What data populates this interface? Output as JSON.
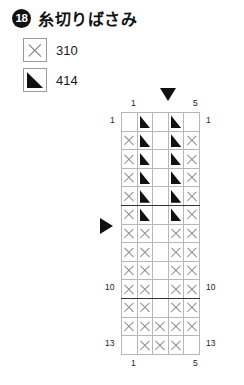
{
  "header": {
    "number": "18",
    "title": "糸切りばさみ"
  },
  "legend": {
    "items": [
      {
        "symbol": "cross",
        "symbol_name": "cross-symbol",
        "label": "310"
      },
      {
        "symbol": "triangle",
        "symbol_name": "triangle-symbol",
        "label": "414"
      }
    ]
  },
  "markers": {
    "top_arrow": "down-arrow-marker",
    "left_arrow": "right-arrow-marker"
  },
  "axis": {
    "columns_top": {
      "first": "1",
      "last": "5"
    },
    "columns_bottom": {
      "first": "1",
      "last": "5"
    },
    "rows_left": {
      "first": "1",
      "middle": "10",
      "last": "13"
    },
    "rows_right": {
      "first": "1",
      "middle": "10",
      "last": "13"
    }
  },
  "chart_data": {
    "type": "heatmap",
    "title": "糸切りばさみ",
    "xlabel": "",
    "ylabel": "",
    "columns": 5,
    "rows": 13,
    "legend_position": "top-left",
    "grid": true,
    "symbol_key": {
      "0": "empty",
      "x": "cross-310",
      "t": "triangle-414"
    },
    "cells": [
      [
        "0",
        "t",
        "0",
        "t",
        "0"
      ],
      [
        "x",
        "t",
        "0",
        "t",
        "x"
      ],
      [
        "x",
        "t",
        "0",
        "t",
        "x"
      ],
      [
        "x",
        "t",
        "0",
        "t",
        "x"
      ],
      [
        "x",
        "t",
        "0",
        "t",
        "x"
      ],
      [
        "x",
        "t",
        "0",
        "t",
        "x"
      ],
      [
        "x",
        "x",
        "0",
        "x",
        "x"
      ],
      [
        "x",
        "x",
        "0",
        "x",
        "x"
      ],
      [
        "x",
        "x",
        "0",
        "x",
        "x"
      ],
      [
        "x",
        "x",
        "0",
        "x",
        "x"
      ],
      [
        "x",
        "x",
        "0",
        "x",
        "x"
      ],
      [
        "x",
        "x",
        "x",
        "x",
        "x"
      ],
      [
        "0",
        "x",
        "x",
        "x",
        "0"
      ]
    ],
    "heavy_row_separators": [
      5,
      10
    ],
    "arrow_column": 3,
    "arrow_row": 7
  }
}
